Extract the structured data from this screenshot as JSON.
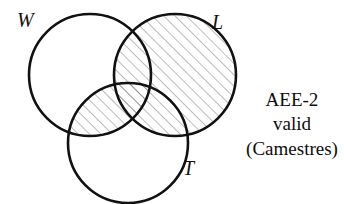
{
  "diagram": {
    "type": "venn-3-set",
    "title": "",
    "background_color": "#ffffff",
    "stroke_color": "#111111",
    "hatch_color": "#7a7a7a",
    "sets": [
      {
        "id": "W",
        "label": "W",
        "cx": 90,
        "cy": 75,
        "r": 61
      },
      {
        "id": "L",
        "label": "L",
        "cx": 175,
        "cy": 75,
        "r": 61
      },
      {
        "id": "T",
        "label": "T",
        "cx": 128,
        "cy": 143,
        "r": 60
      }
    ],
    "shaded_regions": [
      "L",
      "L_and_W",
      "L_and_T",
      "L_and_W_and_T",
      "W_and_T"
    ],
    "shading": {
      "pattern": "diagonal-hatch",
      "angle_degrees": 45,
      "direction": "lower-left-to-upper-right",
      "spacing_px": 8,
      "line_width_px": 1
    }
  },
  "labels": {
    "w": "W",
    "l": "L",
    "t": "T"
  },
  "caption": {
    "line1": "AEE-2",
    "line2": "valid",
    "line3": "(Camestres)"
  }
}
